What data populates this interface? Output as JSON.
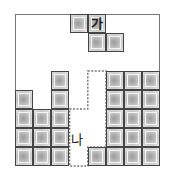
{
  "board": {
    "cols": 8,
    "rows": 8,
    "cell_w": 18.1,
    "cell_h": 19
  },
  "filled_cells": [
    [
      0,
      4
    ],
    [
      0,
      5
    ],
    [
      0,
      6
    ],
    [
      0,
      7
    ],
    [
      1,
      5
    ],
    [
      1,
      6
    ],
    [
      1,
      7
    ],
    [
      2,
      3
    ],
    [
      2,
      4
    ],
    [
      2,
      5
    ],
    [
      2,
      6
    ],
    [
      2,
      7
    ],
    [
      4,
      7
    ],
    [
      5,
      3
    ],
    [
      5,
      4
    ],
    [
      5,
      5
    ],
    [
      5,
      6
    ],
    [
      5,
      7
    ],
    [
      6,
      3
    ],
    [
      6,
      4
    ],
    [
      6,
      5
    ],
    [
      6,
      6
    ],
    [
      6,
      7
    ],
    [
      7,
      3
    ],
    [
      7,
      4
    ],
    [
      7,
      5
    ],
    [
      7,
      6
    ],
    [
      7,
      7
    ]
  ],
  "falling_piece": {
    "label": "가",
    "cells": [
      [
        3,
        0
      ],
      [
        4,
        0
      ],
      [
        4,
        1
      ],
      [
        5,
        1
      ]
    ],
    "label_cell": [
      4,
      0
    ]
  },
  "target_slot": {
    "label": "나",
    "cells": [
      [
        3,
        5
      ],
      [
        3,
        6
      ],
      [
        3,
        7
      ],
      [
        4,
        3
      ],
      [
        4,
        4
      ],
      [
        4,
        5
      ],
      [
        4,
        6
      ]
    ]
  }
}
